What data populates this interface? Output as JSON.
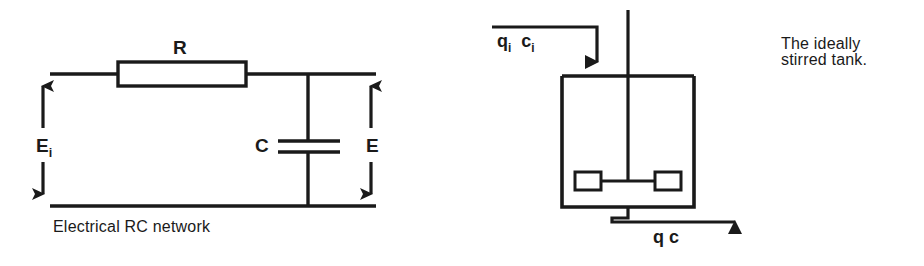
{
  "figure": {
    "width": 924,
    "height": 266,
    "background": "#ffffff",
    "ink_color": "#1a1a1a"
  },
  "left_diagram": {
    "name": "electrical-rc-network",
    "caption": "Electrical RC network",
    "labels": {
      "resistor": "R",
      "capacitor": "C",
      "input_voltage_main": "E",
      "input_voltage_sub": "i",
      "output_voltage": "E"
    },
    "components": [
      {
        "type": "resistor",
        "label": "R"
      },
      {
        "type": "capacitor",
        "label": "C"
      },
      {
        "type": "input-voltage-arrow",
        "label": "Ei"
      },
      {
        "type": "output-voltage-arrow",
        "label": "E"
      }
    ]
  },
  "right_diagram": {
    "name": "ideally-stirred-tank",
    "caption_line1": "The ideally",
    "caption_line2": "stirred tank.",
    "inlet": {
      "flow_symbol": "q",
      "flow_sub": "i",
      "conc_symbol": "c",
      "conc_sub": "i"
    },
    "outlet": {
      "flow_symbol": "q",
      "conc_symbol": "c"
    },
    "components": [
      {
        "type": "tank-vessel"
      },
      {
        "type": "stirrer-shaft"
      },
      {
        "type": "impeller-blade-left"
      },
      {
        "type": "impeller-blade-right"
      },
      {
        "type": "inlet-pipe"
      },
      {
        "type": "outlet-pipe"
      }
    ]
  }
}
